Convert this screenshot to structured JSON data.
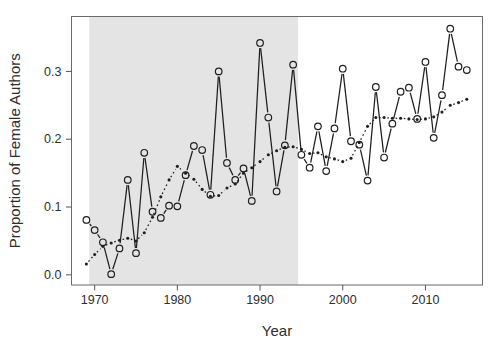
{
  "chart_data": {
    "type": "line",
    "title": "",
    "xlabel": "Year",
    "ylabel": "Proportion of Female Authors",
    "x_ticks": [
      1970,
      1980,
      1990,
      2000,
      2010
    ],
    "x_tick_labels": [
      "1970",
      "1980",
      "1990",
      "2000",
      "2010"
    ],
    "y_ticks": [
      0.0,
      0.1,
      0.2,
      0.3
    ],
    "y_tick_labels": [
      "0.0",
      "0.1",
      "0.2",
      "0.3"
    ],
    "xlim": [
      1967.2,
      2016.9
    ],
    "ylim": [
      -0.015,
      0.381
    ],
    "grid": false,
    "legend": "none",
    "background_color": "#ffffff",
    "frame_color": "#6b6b6b",
    "shaded_region": {
      "x_start": 1969.35,
      "x_end": 1994.6,
      "color": "#e4e4e4"
    },
    "x": [
      1969,
      1970,
      1971,
      1972,
      1973,
      1974,
      1975,
      1976,
      1977,
      1978,
      1979,
      1980,
      1981,
      1982,
      1983,
      1984,
      1985,
      1986,
      1987,
      1988,
      1989,
      1990,
      1991,
      1992,
      1993,
      1994,
      1995,
      1996,
      1997,
      1998,
      1999,
      2000,
      2001,
      2002,
      2003,
      2004,
      2005,
      2006,
      2007,
      2008,
      2009,
      2010,
      2011,
      2012,
      2013,
      2014,
      2015
    ],
    "series": [
      {
        "name": "annual proportion",
        "marker": "open-circle",
        "line_style": "solid",
        "color": "#1f1f1f",
        "values": [
          0.081,
          0.066,
          0.048,
          0.001,
          0.039,
          0.14,
          0.032,
          0.18,
          0.093,
          0.084,
          0.102,
          0.101,
          0.147,
          0.19,
          0.184,
          0.118,
          0.3,
          0.165,
          0.14,
          0.157,
          0.109,
          0.342,
          0.232,
          0.123,
          0.191,
          0.31,
          0.177,
          0.158,
          0.219,
          0.153,
          0.216,
          0.304,
          0.197,
          0.192,
          0.139,
          0.277,
          0.173,
          0.223,
          0.27,
          0.276,
          0.23,
          0.314,
          0.202,
          0.265,
          0.363,
          0.307,
          0.302
        ]
      },
      {
        "name": "smoothed trend",
        "marker": "small-dot",
        "line_style": "dotted",
        "color": "#1f1f1f",
        "values": [
          0.016,
          0.03,
          0.042,
          0.047,
          0.051,
          0.054,
          0.05,
          0.062,
          0.085,
          0.115,
          0.14,
          0.16,
          0.15,
          0.141,
          0.126,
          0.116,
          0.117,
          0.128,
          0.134,
          0.15,
          0.158,
          0.167,
          0.177,
          0.183,
          0.188,
          0.189,
          0.185,
          0.179,
          0.18,
          0.174,
          0.171,
          0.167,
          0.172,
          0.195,
          0.219,
          0.232,
          0.232,
          0.231,
          0.231,
          0.23,
          0.229,
          0.23,
          0.233,
          0.24,
          0.25,
          0.254,
          0.259
        ]
      }
    ]
  }
}
